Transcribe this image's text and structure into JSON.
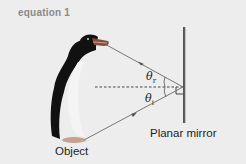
{
  "header": {
    "label": "equation 1"
  },
  "diagram": {
    "object_label": "Object",
    "mirror_label": "Planar mirror",
    "angle_reflection": {
      "symbol": "θ",
      "subscript": "r"
    },
    "angle_incidence": {
      "symbol": "θ",
      "subscript": "i"
    },
    "colors": {
      "background": "#ededed",
      "ray": "#6e6e6e",
      "mirror": "#555555",
      "penguin_body": "#111111",
      "beak": "#8a4a3a",
      "feet": "#b06a4a",
      "normal_line": "#444444"
    }
  }
}
